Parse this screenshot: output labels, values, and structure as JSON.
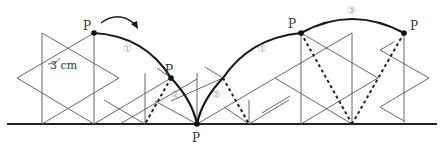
{
  "diagram": {
    "type": "rolling-hexagram-trace",
    "point_label": "P",
    "measurement_label": "3 cm",
    "arc_labels": {
      "arc1_first": "①",
      "arc2_first": "②",
      "arc2_second": "②",
      "arc1_second": "①",
      "arc3": "③"
    },
    "colors": {
      "line": "#555555",
      "path": "#1a1a1a",
      "label_circle": "#aaaaaa"
    }
  }
}
